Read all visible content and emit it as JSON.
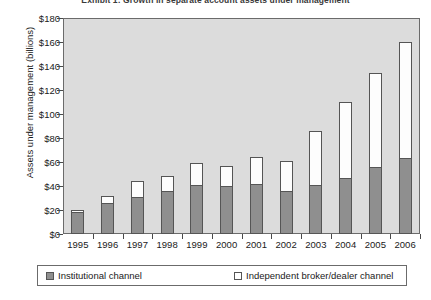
{
  "chart_data": {
    "type": "bar",
    "subtype": "stacked-column",
    "title": "Exhibit 1: Growth in separate account assets under management",
    "xlabel": "",
    "ylabel": "Assets under management (billions)",
    "categories": [
      "1995",
      "1996",
      "1997",
      "1998",
      "1999",
      "2000",
      "2001",
      "2002",
      "2003",
      "2004",
      "2005",
      "2006"
    ],
    "series": [
      {
        "name": "Institutional channel",
        "color": "#8f8f8f",
        "values": [
          18,
          26,
          31,
          36,
          41,
          40,
          42,
          36,
          41,
          47,
          56,
          63
        ]
      },
      {
        "name": "Independent broker/dealer channel",
        "color": "#ffffff",
        "values": [
          2,
          6,
          13,
          12,
          18,
          17,
          22,
          25,
          45,
          63,
          78,
          97
        ]
      }
    ],
    "totals": [
      20,
      32,
      44,
      48,
      59,
      57,
      64,
      61,
      86,
      110,
      134,
      160
    ],
    "ylim": [
      0,
      180
    ],
    "yticks": [
      0,
      20,
      40,
      60,
      80,
      100,
      120,
      140,
      160,
      180
    ],
    "ytick_labels": [
      "$0",
      "$20",
      "$40",
      "$60",
      "$80",
      "$100",
      "$120",
      "$140",
      "$160",
      "$180"
    ],
    "grid": false,
    "legend_position": "bottom",
    "plot_background": "#dcdcdc",
    "figure_background": "#ffffff"
  }
}
